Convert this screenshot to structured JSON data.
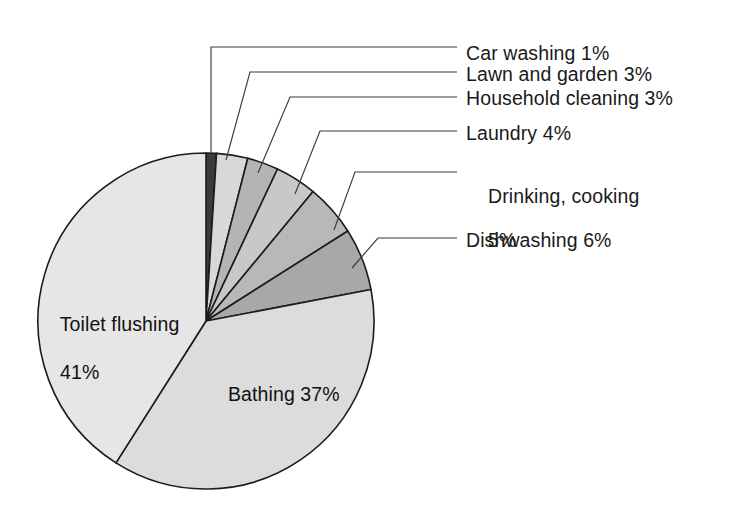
{
  "chart_data": {
    "type": "pie",
    "title": "",
    "subtitle": "",
    "xlabel": "",
    "ylabel": "",
    "legend_position": "none",
    "grid": false,
    "units": "percent",
    "start_angle_deg": 0,
    "direction": "clockwise",
    "categories": [
      "Car washing",
      "Lawn and garden",
      "Household cleaning",
      "Laundry",
      "Drinking, cooking",
      "Dishwashing",
      "Bathing",
      "Toilet flushing"
    ],
    "values": [
      1,
      3,
      3,
      4,
      5,
      6,
      37,
      41
    ],
    "colors": [
      "#3a3a3a",
      "#d8d8d8",
      "#b4b4b4",
      "#c8c8c8",
      "#b8b8b8",
      "#a8a8a8",
      "#dcdcdc",
      "#e6e6e6"
    ],
    "slices": [
      {
        "label": "Car washing",
        "value": 1,
        "display": "Car washing 1%",
        "color": "#3a3a3a",
        "placement": "callout"
      },
      {
        "label": "Lawn and garden",
        "value": 3,
        "display": "Lawn and garden 3%",
        "color": "#d8d8d8",
        "placement": "callout"
      },
      {
        "label": "Household cleaning",
        "value": 3,
        "display": "Household cleaning 3%",
        "color": "#b4b4b4",
        "placement": "callout"
      },
      {
        "label": "Laundry",
        "value": 4,
        "display": "Laundry 4%",
        "color": "#c8c8c8",
        "placement": "callout"
      },
      {
        "label": "Drinking, cooking",
        "value": 5,
        "display": "Drinking, cooking 5%",
        "color": "#b8b8b8",
        "placement": "callout"
      },
      {
        "label": "Dishwashing",
        "value": 6,
        "display": "Dishwashing 6%",
        "color": "#a8a8a8",
        "placement": "callout"
      },
      {
        "label": "Bathing",
        "value": 37,
        "display": "Bathing 37%",
        "color": "#dcdcdc",
        "placement": "inside"
      },
      {
        "label": "Toilet flushing",
        "value": 41,
        "display": "Toilet flushing 41%",
        "color": "#e6e6e6",
        "placement": "inside"
      }
    ]
  },
  "callouts": {
    "car_washing": "Car washing 1%",
    "lawn_and_garden": "Lawn and garden 3%",
    "household_cleaning": "Household cleaning 3%",
    "laundry": "Laundry 4%",
    "drinking_cooking_line1": "Drinking, cooking",
    "drinking_cooking_line2": "5%",
    "dishwashing": "Dishwashing 6%"
  },
  "inside_labels": {
    "toilet_flushing_line1": "Toilet flushing",
    "toilet_flushing_line2": "41%",
    "bathing": "Bathing 37%"
  }
}
